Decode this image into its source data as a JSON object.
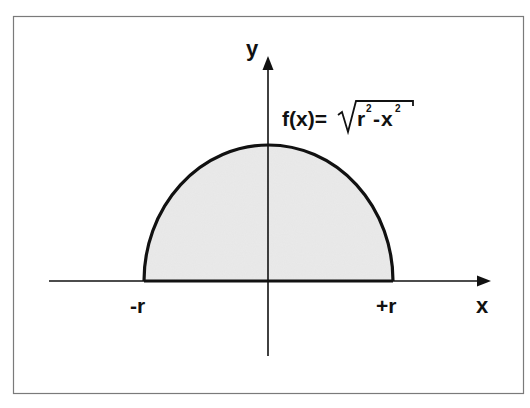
{
  "figure": {
    "frame": {
      "x": 13,
      "y": 16,
      "width": 510,
      "height": 377,
      "stroke": "#7a7a7a"
    },
    "colors": {
      "fill": "#e6e6e6",
      "curve": "#111111",
      "axis": "#111111",
      "text": "#111111"
    }
  },
  "axes": {
    "x_label": "x",
    "y_label": "y",
    "origin": {
      "x": 268,
      "y": 281
    },
    "x_axis": {
      "from": 49,
      "to": 490
    },
    "y_axis": {
      "from": 356,
      "to": 56
    }
  },
  "labels": {
    "neg_r": "-r",
    "pos_r": "+r",
    "formula_prefix": "f(x)=",
    "formula_r": "r",
    "formula_r_exp": "2",
    "formula_minus": "-",
    "formula_x": "x",
    "formula_x_exp": "2"
  },
  "shape": {
    "type": "semicircle",
    "left_x": 144,
    "right_x": 393,
    "top_y": 145,
    "base_y": 281
  }
}
